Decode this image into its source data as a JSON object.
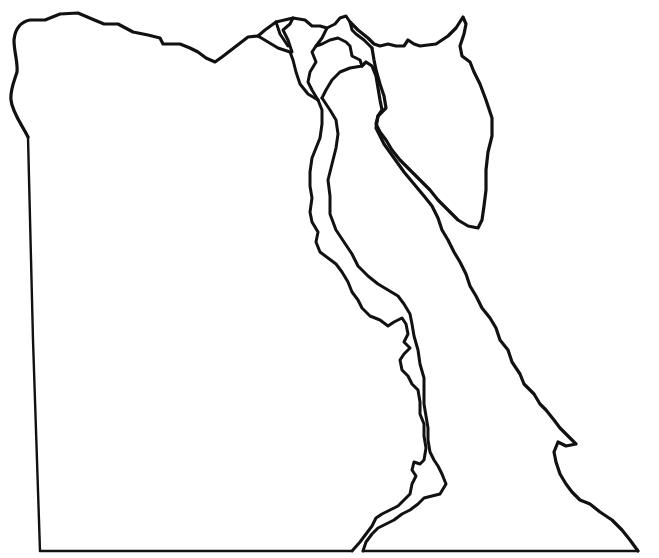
{
  "map": {
    "subject": "Egypt outline map (blank)",
    "background_color": "#ffffff",
    "line_color": "#111111",
    "labels": [],
    "features": [
      {
        "id": "west-border",
        "name": "Western border (Libya)"
      },
      {
        "id": "south-border",
        "name": "Southern border (Sudan)"
      },
      {
        "id": "north-coast",
        "name": "Mediterranean coastline"
      },
      {
        "id": "nile-delta",
        "name": "Nile Delta branches"
      },
      {
        "id": "nile-west-bank",
        "name": "Nile River west bank"
      },
      {
        "id": "nile-east-bank",
        "name": "Nile River east bank"
      },
      {
        "id": "lake-nasser",
        "name": "Lake Nasser"
      },
      {
        "id": "gulf-of-suez",
        "name": "Gulf of Suez"
      },
      {
        "id": "sinai",
        "name": "Sinai Peninsula"
      },
      {
        "id": "red-sea-coast",
        "name": "Red Sea coastline"
      }
    ]
  }
}
